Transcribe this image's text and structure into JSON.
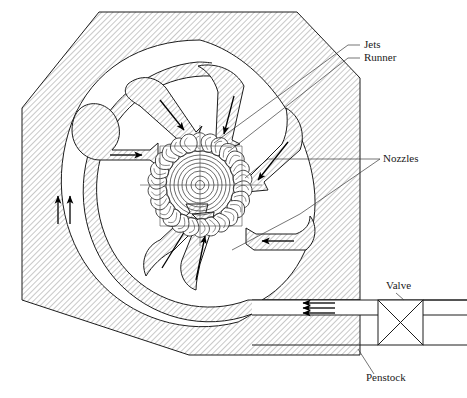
{
  "figure": {
    "background_color": "#ffffff",
    "line_color": "#1c1c1c",
    "hatch_color": "#8c8c8c",
    "canvas": {
      "width": 467,
      "height": 398
    }
  },
  "labels": [
    {
      "id": "jets",
      "text": "Jets",
      "x": 364,
      "y": 48,
      "anchor": "start"
    },
    {
      "id": "runner",
      "text": "Runner",
      "x": 364,
      "y": 61,
      "anchor": "start"
    },
    {
      "id": "nozzles",
      "text": "Nozzles",
      "x": 383,
      "y": 162,
      "anchor": "start"
    },
    {
      "id": "valve",
      "text": "Valve",
      "x": 386,
      "y": 289,
      "anchor": "start"
    },
    {
      "id": "penstock",
      "text": "Penstock",
      "x": 366,
      "y": 381,
      "anchor": "start"
    }
  ],
  "components": {
    "casing": {
      "name": "octagonal turbine housing",
      "shape": "octagon",
      "hatched": true
    },
    "runner": {
      "name": "Pelton runner wheel",
      "bucket_count": 26,
      "center_x": 200,
      "center_y": 185,
      "outer_radius": 52,
      "hub_rings": [
        34,
        30,
        26,
        22,
        18,
        14,
        9,
        4.5
      ]
    },
    "nozzles": {
      "name": "jet nozzles",
      "count": 6,
      "flow_arrows": 6
    },
    "penstock": {
      "name": "penstock supply pipe",
      "flow_arrows": 3,
      "flow_direction": "leftward"
    },
    "valve": {
      "name": "gate valve symbol",
      "symbol": "square-with-x"
    },
    "manifold_arrows": {
      "name": "distributor flow arrows",
      "count": 2,
      "direction": "upward"
    }
  }
}
